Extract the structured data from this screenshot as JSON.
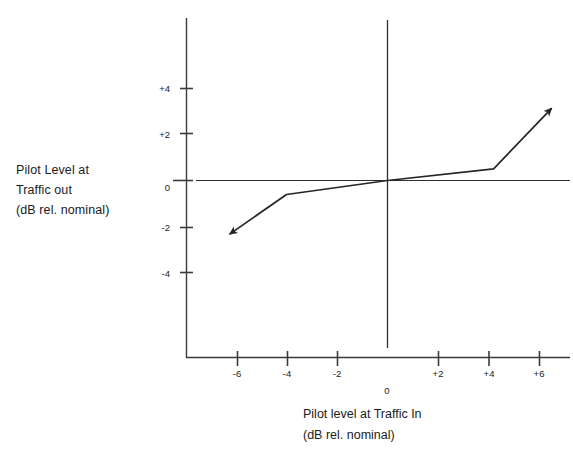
{
  "figure": {
    "title": "",
    "background_color": "#ffffff",
    "line_color": "#262626"
  },
  "axes": {
    "y_caption_lines": [
      "Pilot Level at",
      "Traffic out",
      "(dB rel. nominal)"
    ],
    "x_caption_lines": [
      "Pilot level at Traffic In",
      "(dB rel. nominal)"
    ],
    "y_tick_labels": [
      "+4",
      "+2",
      "0",
      "-2",
      "-4"
    ],
    "x_tick_labels": [
      "-6",
      "-4",
      "-2",
      "0",
      "+2",
      "+4",
      "+6"
    ]
  },
  "chart_data": {
    "type": "line",
    "title": "",
    "xlabel": "Pilot level at Traffic In (dB rel. nominal)",
    "ylabel": "Pilot Level at Traffic out (dB rel. nominal)",
    "xlim": [
      -7.4,
      7.4
    ],
    "ylim": [
      -5.8,
      5.6
    ],
    "xticks": [
      -6,
      -4,
      -2,
      0,
      2,
      4,
      6
    ],
    "xtick_labels": [
      "-6",
      "-4",
      "-2",
      "0",
      "+2",
      "+4",
      "+6"
    ],
    "yticks": [
      4,
      2,
      0,
      -2,
      -4
    ],
    "ytick_labels": [
      "+4",
      "+2",
      "0",
      "-2",
      "-4"
    ],
    "grid": false,
    "legend": "none",
    "reference_lines": [
      {
        "name": "zero-horizontal",
        "orientation": "horizontal",
        "value": 0
      },
      {
        "name": "zero-vertical",
        "orientation": "vertical",
        "value": 0
      }
    ],
    "series": [
      {
        "name": "pilot level transfer characteristic",
        "arrow_start": true,
        "arrow_end": true,
        "x": [
          -6.25,
          -4.0,
          0.0,
          4.2,
          6.5
        ],
        "y": [
          -2.3,
          -0.6,
          0.0,
          0.5,
          3.1
        ]
      }
    ],
    "annotations": []
  }
}
